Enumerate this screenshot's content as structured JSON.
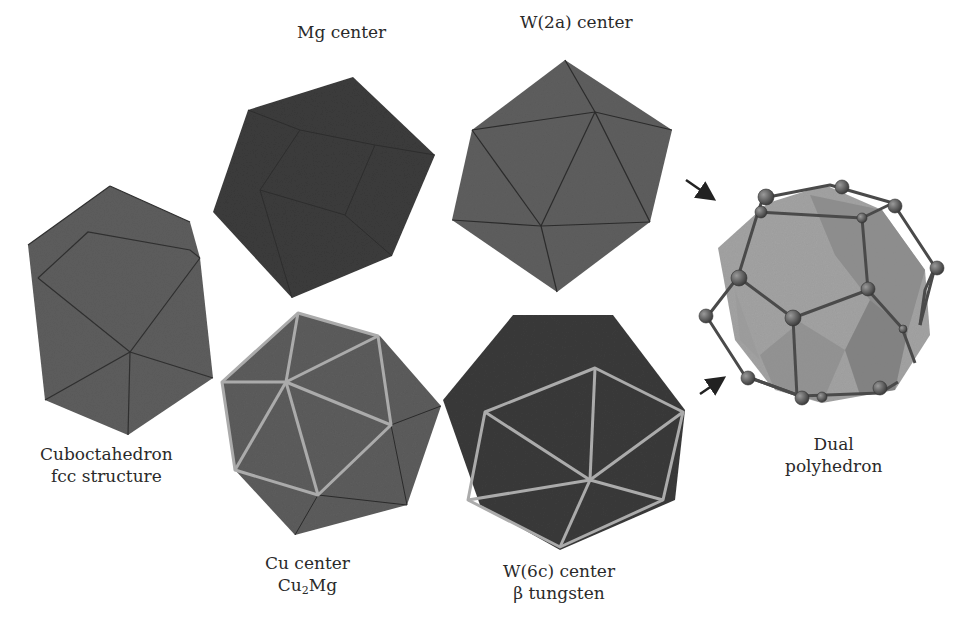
{
  "figure": {
    "colors": {
      "background": "#ffffff",
      "dark_face": "#3a3a3a",
      "mid_face": "#5c5c5c",
      "highlight_edge": "#a9a9a9",
      "edge": "#2a2a2a",
      "dual_light": "#a6a6a6",
      "dual_mid": "#8a8a8a",
      "atom": "#5a5a5a",
      "arrow": "#222222"
    },
    "labels": {
      "mg_center": "Mg center",
      "w2a_center": "W(2a) center",
      "cuboctahedron": {
        "line1": "Cuboctahedron",
        "line2": "fcc structure"
      },
      "cu_center": {
        "line1": "Cu center",
        "line2_main": "Cu",
        "line2_sub": "2",
        "line2_end": "Mg"
      },
      "w6c_center": {
        "line1": "W(6c) center",
        "line2": "β tungsten"
      },
      "dual": {
        "line1": "Dual",
        "line2": "polyhedron"
      }
    },
    "polyhedra": [
      {
        "id": "cuboctahedron",
        "shade": "mid"
      },
      {
        "id": "mg-center",
        "shade": "dark"
      },
      {
        "id": "w2a-center",
        "shade": "mid"
      },
      {
        "id": "cu-center",
        "shade": "mid",
        "highlighted_edges": true
      },
      {
        "id": "w6c-center",
        "shade": "dark",
        "highlighted_edges": true
      },
      {
        "id": "dual-polyhedron",
        "shade": "light",
        "atoms": true
      }
    ],
    "arrows": [
      {
        "id": "arrow-top",
        "direction": "down-right"
      },
      {
        "id": "arrow-bottom",
        "direction": "up-right"
      }
    ]
  }
}
